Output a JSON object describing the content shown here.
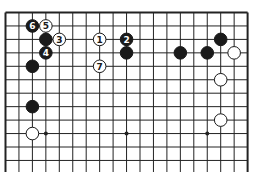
{
  "diagram": {
    "type": "go-board-partial",
    "board_size": 19,
    "visible_rows": 12,
    "edges": [
      "top",
      "left",
      "right"
    ],
    "colors": {
      "line": "#222222",
      "black": "#1a1a1a",
      "white": "#ffffff",
      "background": "#ffffff"
    },
    "star_points": [
      {
        "col": 3,
        "row": 9
      },
      {
        "col": 9,
        "row": 9
      },
      {
        "col": 15,
        "row": 9
      }
    ],
    "stones": [
      {
        "color": "black",
        "col": 2,
        "row": 1,
        "label": "6"
      },
      {
        "color": "white",
        "col": 3,
        "row": 1,
        "label": "5"
      },
      {
        "color": "black",
        "col": 3,
        "row": 2,
        "label": ""
      },
      {
        "color": "white",
        "col": 4,
        "row": 2,
        "label": "3"
      },
      {
        "color": "black",
        "col": 3,
        "row": 3,
        "label": "4"
      },
      {
        "color": "black",
        "col": 2,
        "row": 4,
        "label": ""
      },
      {
        "color": "white",
        "col": 7,
        "row": 2,
        "label": "1"
      },
      {
        "color": "black",
        "col": 9,
        "row": 2,
        "label": "2"
      },
      {
        "color": "black",
        "col": 9,
        "row": 3,
        "label": ""
      },
      {
        "color": "white",
        "col": 7,
        "row": 4,
        "label": "7"
      },
      {
        "color": "black",
        "col": 13,
        "row": 3,
        "label": ""
      },
      {
        "color": "black",
        "col": 15,
        "row": 3,
        "label": ""
      },
      {
        "color": "black",
        "col": 16,
        "row": 2,
        "label": ""
      },
      {
        "color": "white",
        "col": 17,
        "row": 3,
        "label": ""
      },
      {
        "color": "white",
        "col": 16,
        "row": 5,
        "label": ""
      },
      {
        "color": "white",
        "col": 16,
        "row": 8,
        "label": ""
      },
      {
        "color": "black",
        "col": 2,
        "row": 7,
        "label": ""
      },
      {
        "color": "white",
        "col": 2,
        "row": 9,
        "label": ""
      }
    ]
  }
}
